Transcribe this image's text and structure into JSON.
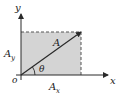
{
  "diagram": {
    "colors": {
      "shade": "#d4d4d4",
      "line": "#2a2a2a",
      "dashed": "#555555",
      "background": "#ffffff"
    },
    "labels": {
      "y_axis": "y",
      "x_axis": "x",
      "origin": "o",
      "vector": "A",
      "angle": "θ",
      "y_component": "A",
      "y_component_sub": "y",
      "x_component": "A",
      "x_component_sub": "x"
    }
  }
}
